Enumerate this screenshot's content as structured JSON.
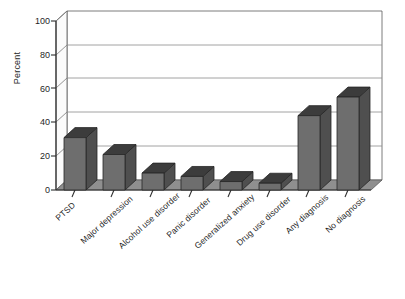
{
  "figure": {
    "y_axis_title": "Percent",
    "background_color": "#ffffff",
    "bar_front_color": "#6e6e6e",
    "bar_top_color": "#3c3c3c",
    "bar_side_color": "#4f4f4f",
    "axis_color": "#3a3a3a",
    "gridline_color": "#8c8c8c",
    "floor_color": "#8f8f8f",
    "wall_color": "#ffffff"
  },
  "chart_data": {
    "type": "bar",
    "title": "",
    "xlabel": "",
    "ylabel": "Percent",
    "ylim": [
      0,
      100
    ],
    "yticks": [
      0,
      20,
      40,
      60,
      80,
      100
    ],
    "ytick_labels": [
      "0",
      "20",
      "40",
      "60",
      "80",
      "100"
    ],
    "grid": true,
    "grid_axis": "y",
    "legend": false,
    "legend_position": "none",
    "style": "3d-column",
    "categories": [
      "PTSD",
      "Major depression",
      "Alcohol use disorder",
      "Panic disorder",
      "Generalized anxiety",
      "Drug use disorder",
      "Any diagnosis",
      "No diagnosis"
    ],
    "values": [
      31,
      21,
      10,
      8,
      5,
      4,
      44,
      55
    ],
    "series": [
      {
        "name": "Percent",
        "values": [
          31,
          21,
          10,
          8,
          5,
          4,
          44,
          55
        ]
      }
    ]
  }
}
